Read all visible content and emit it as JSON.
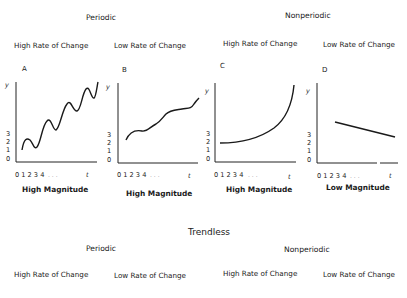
{
  "top": {
    "periodic_label": "Periodic",
    "nonperiodic_label": "Nonperiodic",
    "rates": [
      "High Rate of Change",
      "Low Rate of Change",
      "High Rate of Change",
      "Low Rate of Change"
    ]
  },
  "panels": [
    {
      "letter": "A",
      "group": "Periodic",
      "rate": "High Rate of Change",
      "magnitude": "High Magnitude",
      "curve": "oscillating rising trend"
    },
    {
      "letter": "B",
      "group": "Periodic",
      "rate": "Low Rate of Change",
      "magnitude": "High Magnitude",
      "curve": "gently undulating rising trend"
    },
    {
      "letter": "C",
      "group": "Nonperiodic",
      "rate": "High Rate of Change",
      "magnitude": "High Magnitude",
      "curve": "exponential rise"
    },
    {
      "letter": "D",
      "group": "Nonperiodic",
      "rate": "Low Rate of Change",
      "magnitude": "Low Magnitude",
      "curve": "linear decline"
    }
  ],
  "axes": {
    "y_label": "y",
    "x_label": "t",
    "y_ticks": [
      "0",
      "1",
      "2",
      "3"
    ],
    "x_ticks": "0 1 2 3 4",
    "x_ellipsis": ". . ."
  },
  "bottom": {
    "title": "Trendless",
    "periodic_label": "Periodic",
    "nonperiodic_label": "Nonperiodic",
    "rates": [
      "High Rate of Change",
      "Low Rate of Change",
      "High Rate of Change",
      "Low Rate of Change"
    ]
  }
}
